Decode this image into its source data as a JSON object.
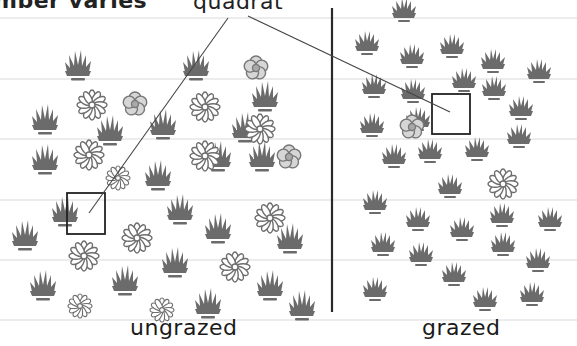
{
  "diagram": {
    "title_fragment": "mber varies",
    "callout_label": "quadrat",
    "fields": [
      {
        "name": "ungrazed",
        "label": "ungrazed",
        "quadrat": {
          "x": 67,
          "y": 193,
          "w": 38,
          "h": 41
        },
        "grass": [
          [
            78,
            66
          ],
          [
            45,
            120
          ],
          [
            110,
            131
          ],
          [
            163,
            125
          ],
          [
            196,
            66
          ],
          [
            265,
            97
          ],
          [
            45,
            160
          ],
          [
            158,
            176
          ],
          [
            245,
            128
          ],
          [
            262,
            157
          ],
          [
            218,
            157
          ],
          [
            180,
            210
          ],
          [
            65,
            212
          ],
          [
            25,
            236
          ],
          [
            218,
            229
          ],
          [
            290,
            239
          ],
          [
            43,
            286
          ],
          [
            125,
            281
          ],
          [
            175,
            263
          ],
          [
            270,
            286
          ]
        ],
        "grass_partial": [
          [
            208,
            304
          ],
          [
            302,
            306
          ]
        ],
        "daisies": [
          [
            92,
            105
          ],
          [
            205,
            107
          ],
          [
            89,
            155
          ],
          [
            260,
            129
          ],
          [
            205,
            156
          ],
          [
            270,
            218
          ],
          [
            137,
            238
          ],
          [
            84,
            256
          ],
          [
            235,
            267
          ]
        ],
        "daisies_partial": [
          [
            80,
            306
          ],
          [
            162,
            310
          ],
          [
            118,
            178
          ]
        ],
        "roses": [
          [
            135,
            104
          ],
          [
            256,
            68
          ],
          [
            289,
            157
          ]
        ]
      },
      {
        "name": "grazed",
        "label": "grazed",
        "quadrat": {
          "x": 432,
          "y": 94,
          "w": 38,
          "h": 40
        },
        "grass": [
          [
            404,
            10
          ],
          [
            367,
            43
          ],
          [
            412,
            56
          ],
          [
            452,
            46
          ],
          [
            493,
            61
          ],
          [
            539,
            71
          ],
          [
            374,
            86
          ],
          [
            413,
            91
          ],
          [
            464,
            80
          ],
          [
            494,
            88
          ],
          [
            418,
            119
          ],
          [
            521,
            108
          ],
          [
            372,
            125
          ],
          [
            430,
            151
          ],
          [
            477,
            149
          ],
          [
            519,
            136
          ],
          [
            394,
            156
          ],
          [
            450,
            186
          ],
          [
            375,
            202
          ],
          [
            418,
            219
          ],
          [
            462,
            229
          ],
          [
            502,
            215
          ],
          [
            550,
            219
          ],
          [
            383,
            244
          ],
          [
            421,
            254
          ],
          [
            503,
            244
          ],
          [
            538,
            260
          ],
          [
            454,
            274
          ],
          [
            375,
            289
          ],
          [
            485,
            299
          ],
          [
            532,
            294
          ]
        ],
        "grass_partial": [],
        "daisies": [
          [
            503,
            184
          ]
        ],
        "daisies_partial": [],
        "roses": [
          [
            412,
            127
          ]
        ]
      }
    ],
    "guide_lines_y": [
      18,
      79,
      139,
      200,
      260,
      320
    ],
    "divider": {
      "x": 332,
      "y1": 8,
      "y2": 312
    },
    "callout_lines": [
      {
        "x1": 228,
        "y1": 18,
        "x2": 89,
        "y2": 213
      },
      {
        "x1": 248,
        "y1": 16,
        "x2": 450,
        "y2": 112
      }
    ],
    "colors": {
      "plant": "#6b6b6b",
      "daisy_stroke": "#6e6e6e",
      "rose_fill": "#d6d6d6",
      "rose_center": "#a8a8a8",
      "guide_line": "#d9d9d9",
      "divider": "#2a2a2a",
      "quadrat": "#222222",
      "callout": "#444444"
    }
  }
}
